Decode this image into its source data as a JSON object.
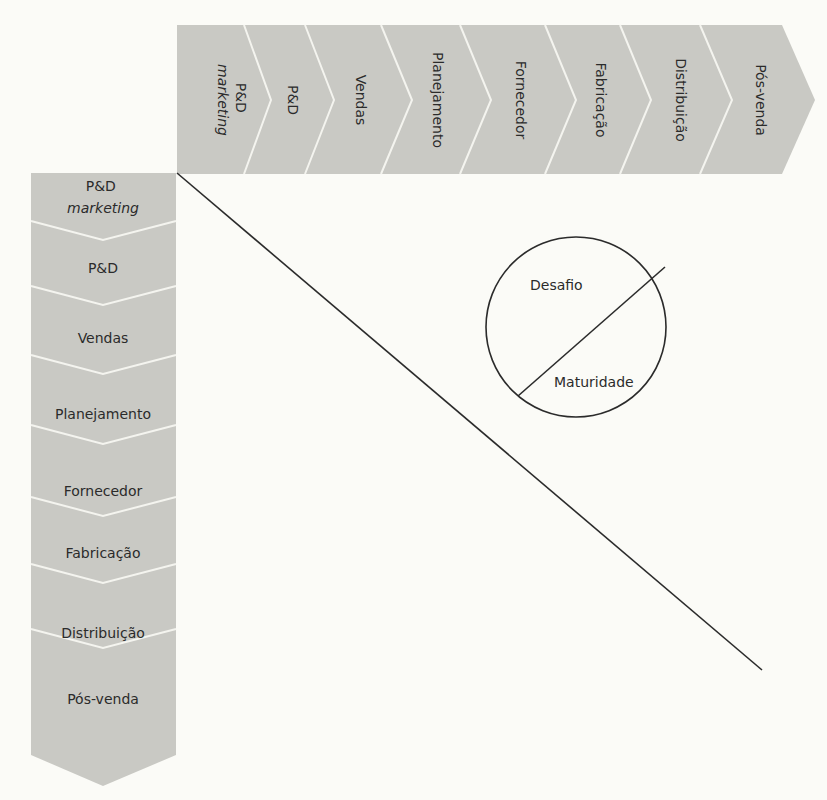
{
  "diagram": {
    "type": "matrix-of-value-chain-stages",
    "colors": {
      "background": "#fbfbf7",
      "band_fill": "#c9c9c4",
      "separator": "#f4f4ef",
      "line": "#2b2b2b",
      "text": "#2b2b2b"
    },
    "top_band": {
      "orientation": "horizontal-arrow-right",
      "stages": [
        {
          "line1": "P&D",
          "line2": "marketing"
        },
        {
          "line1": "P&D"
        },
        {
          "line1": "Vendas"
        },
        {
          "line1": "Planejamento"
        },
        {
          "line1": "Fornecedor"
        },
        {
          "line1": "Fabricação"
        },
        {
          "line1": "Distribuição"
        },
        {
          "line1": "Pós-venda"
        }
      ]
    },
    "left_band": {
      "orientation": "vertical-arrow-down",
      "stages": [
        {
          "line1": "P&D",
          "line2": "marketing"
        },
        {
          "line1": "P&D"
        },
        {
          "line1": "Vendas"
        },
        {
          "line1": "Planejamento"
        },
        {
          "line1": "Fornecedor"
        },
        {
          "line1": "Fabricação"
        },
        {
          "line1": "Distribuição"
        },
        {
          "line1": "Pós-venda"
        }
      ]
    },
    "diagonal": {
      "description": "diagonal line from matrix origin toward lower right"
    },
    "circle": {
      "upper_label": "Desafio",
      "lower_label": "Maturidade"
    }
  }
}
